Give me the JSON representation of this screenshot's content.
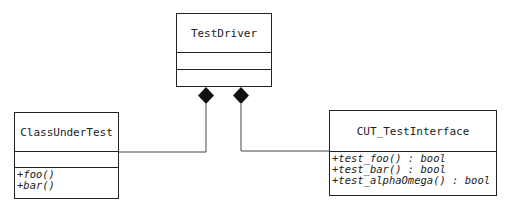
{
  "diagram": {
    "type": "uml-class",
    "classes": [
      {
        "id": "TestDriver",
        "name": "TestDriver",
        "attributes": [],
        "operations": []
      },
      {
        "id": "ClassUnderTest",
        "name": "ClassUnderTest",
        "attributes": [],
        "operations": [
          "+foo()",
          "+bar()"
        ]
      },
      {
        "id": "CUT_TestInterface",
        "name": "CUT_TestInterface",
        "operations": [
          "+test_foo() : bool",
          "+test_bar() : bool",
          "+test_alphaOmega() : bool"
        ]
      }
    ],
    "relations": [
      {
        "type": "composition",
        "from": "TestDriver",
        "to": "ClassUnderTest"
      },
      {
        "type": "composition",
        "from": "TestDriver",
        "to": "CUT_TestInterface"
      }
    ]
  }
}
